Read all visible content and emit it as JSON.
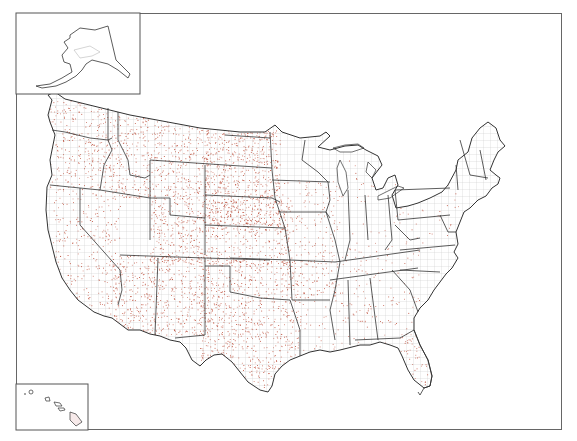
{
  "map": {
    "type": "dot-density-county-map",
    "region": "United States",
    "insets": [
      "Alaska",
      "Hawaii"
    ],
    "colors": {
      "background": "#ffffff",
      "frame_border": "#666666",
      "state_border": "#333333",
      "county_border": "#b8b8b8",
      "dot": "#b8402a",
      "water_tint": "#eef3f8"
    },
    "dot_density_regions": [
      {
        "name": "Pacific Northwest",
        "density": "medium"
      },
      {
        "name": "California",
        "density": "medium"
      },
      {
        "name": "Montana",
        "density": "high"
      },
      {
        "name": "Wyoming",
        "density": "high"
      },
      {
        "name": "Dakotas",
        "density": "high"
      },
      {
        "name": "Nebraska",
        "density": "high"
      },
      {
        "name": "Kansas",
        "density": "high"
      },
      {
        "name": "Colorado",
        "density": "high"
      },
      {
        "name": "Arizona",
        "density": "high"
      },
      {
        "name": "New Mexico",
        "density": "high"
      },
      {
        "name": "Oklahoma",
        "density": "high"
      },
      {
        "name": "Texas",
        "density": "high"
      },
      {
        "name": "Midwest",
        "density": "low"
      },
      {
        "name": "Southeast",
        "density": "low"
      },
      {
        "name": "Northeast",
        "density": "very-low"
      }
    ]
  }
}
